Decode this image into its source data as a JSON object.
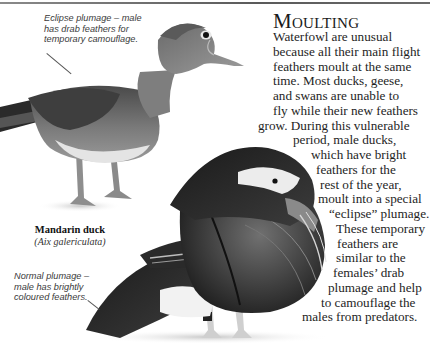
{
  "heading": "Moulting",
  "body_lines": [
    {
      "text": "Waterfowl are unusual",
      "x": 273
    },
    {
      "text": "because all their main flight",
      "x": 273
    },
    {
      "text": "feathers moult at the same",
      "x": 273
    },
    {
      "text": "time. Most ducks, geese,",
      "x": 273
    },
    {
      "text": "and swans are unable to",
      "x": 273
    },
    {
      "text": "fly while their new feathers",
      "x": 273
    },
    {
      "text": "grow. During this vulnerable",
      "x": 258
    },
    {
      "text": "period, male ducks,",
      "x": 293
    },
    {
      "text": "which have bright",
      "x": 311
    },
    {
      "text": "feathers for the",
      "x": 316
    },
    {
      "text": "rest of the year,",
      "x": 320
    },
    {
      "text": "moult into a special",
      "x": 318
    },
    {
      "text": "“eclipse” plumage.",
      "x": 329
    },
    {
      "text": "These temporary",
      "x": 336
    },
    {
      "text": "feathers are",
      "x": 337
    },
    {
      "text": "similar to the",
      "x": 336
    },
    {
      "text": "females’ drab",
      "x": 333
    },
    {
      "text": "plumage and help",
      "x": 328
    },
    {
      "text": "to camouflage the",
      "x": 321
    },
    {
      "text": "males from predators.",
      "x": 302
    }
  ],
  "captions": {
    "eclipse": "Eclipse plumage – male has drab feathers for temporary camouflage.",
    "normal": "Normal plumage – male has brightly coloured feathers."
  },
  "species": {
    "common_name": "Mandarin duck",
    "latin_name": "(Aix galericulata)"
  },
  "images": {
    "eclipse_duck": "eclipse-plumage-mandarin-duck-photo",
    "normal_duck": "normal-plumage-mandarin-duck-photo"
  },
  "colors": {
    "rule": "#6a6a6a",
    "text": "#1e1e1e",
    "caption": "#3a3a3a"
  }
}
